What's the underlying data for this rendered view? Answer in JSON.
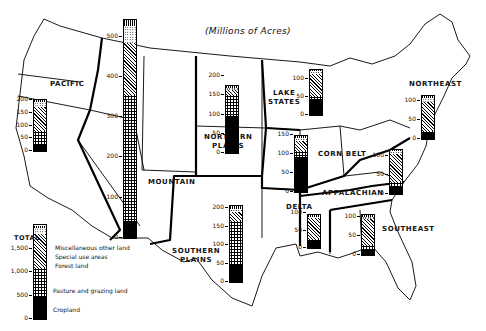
{
  "title": "(Millions of Acres)",
  "legend": {
    "heading": "TOTAL",
    "items": [
      {
        "key": "misc",
        "label": "Miscellaneous other land"
      },
      {
        "key": "special",
        "label": "Special use areas"
      },
      {
        "key": "forest",
        "label": "Forest land"
      },
      {
        "key": "pasture",
        "label": "Pasture and grazing land"
      },
      {
        "key": "crop",
        "label": "Cropland"
      }
    ],
    "axis_ticks": [
      "0",
      "500",
      "1,000",
      "1,500"
    ]
  },
  "regions": [
    {
      "name": "PACIFIC",
      "label_lines": [
        "PACIFIC"
      ],
      "ticks": [
        "0",
        "50",
        "100",
        "150",
        "200"
      ]
    },
    {
      "name": "MOUNTAIN",
      "label_lines": [
        "MOUNTAIN"
      ],
      "ticks": [
        "0",
        "100",
        "200",
        "300",
        "400",
        "500"
      ]
    },
    {
      "name": "NORTHERN PLAINS",
      "label_lines": [
        "NORTHERN",
        "PLAINS"
      ],
      "ticks": [
        "0",
        "50",
        "100",
        "150",
        "200"
      ]
    },
    {
      "name": "SOUTHERN PLAINS",
      "label_lines": [
        "SOUTHERN",
        "PLAINS"
      ],
      "ticks": [
        "0",
        "50",
        "100",
        "150",
        "200"
      ]
    },
    {
      "name": "LAKE STATES",
      "label_lines": [
        "LAKE",
        "STATES"
      ],
      "ticks": [
        "0",
        "50",
        "100"
      ]
    },
    {
      "name": "CORN BELT",
      "label_lines": [
        "CORN BELT"
      ],
      "ticks": [
        "0",
        "50",
        "100",
        "150"
      ]
    },
    {
      "name": "DELTA",
      "label_lines": [
        "DELTA"
      ],
      "ticks": [
        "0",
        "50",
        "100"
      ]
    },
    {
      "name": "NORTHEAST",
      "label_lines": [
        "NORTHEAST"
      ],
      "ticks": [
        "0",
        "50",
        "100"
      ]
    },
    {
      "name": "APPALACHIAN",
      "label_lines": [
        "APPALACHIAN"
      ],
      "ticks": [
        "0",
        "50",
        "100"
      ]
    },
    {
      "name": "SOUTHEAST",
      "label_lines": [
        "SOUTHEAST"
      ],
      "ticks": [
        "0",
        "50",
        "100"
      ]
    }
  ],
  "chart_data": {
    "type": "bar",
    "subtype": "stacked-bar-on-map",
    "title": "(Millions of Acres)",
    "xlabel": "",
    "ylabel": "Millions of Acres",
    "legend_position": "bottom-left",
    "categories": [
      "Pacific",
      "Mountain",
      "Northern Plains",
      "Southern Plains",
      "Lake States",
      "Corn Belt",
      "Delta",
      "Northeast",
      "Appalachian",
      "Southeast",
      "Total"
    ],
    "series": [
      {
        "name": "Cropland",
        "values": [
          25,
          43,
          97,
          45,
          45,
          92,
          20,
          15,
          22,
          17,
          460
        ]
      },
      {
        "name": "Pasture and grazing land",
        "values": [
          55,
          312,
          53,
          120,
          8,
          15,
          7,
          7,
          10,
          10,
          630
        ]
      },
      {
        "name": "Forest land",
        "values": [
          92,
          130,
          14,
          25,
          60,
          27,
          58,
          75,
          73,
          68,
          720
        ]
      },
      {
        "name": "Special use areas",
        "values": [
          20,
          40,
          6,
          8,
          8,
          8,
          5,
          10,
          7,
          6,
          120
        ]
      },
      {
        "name": "Miscellaneous other land",
        "values": [
          8,
          15,
          5,
          7,
          5,
          6,
          4,
          5,
          4,
          4,
          60
        ]
      }
    ],
    "totals": [
      200,
      540,
      175,
      205,
      126,
      148,
      94,
      112,
      116,
      105,
      1990
    ],
    "ylim_by_region": {
      "Pacific": [
        0,
        200
      ],
      "Mountain": [
        0,
        540
      ],
      "Northern Plains": [
        0,
        200
      ],
      "Southern Plains": [
        0,
        200
      ],
      "Lake States": [
        0,
        125
      ],
      "Corn Belt": [
        0,
        150
      ],
      "Delta": [
        0,
        100
      ],
      "Northeast": [
        0,
        110
      ],
      "Appalachian": [
        0,
        115
      ],
      "Southeast": [
        0,
        105
      ],
      "Total": [
        0,
        2000
      ]
    },
    "grid": false
  }
}
